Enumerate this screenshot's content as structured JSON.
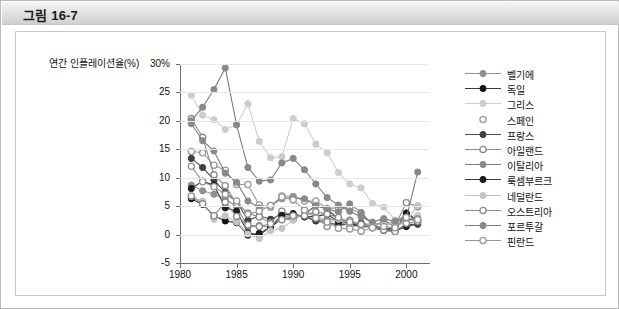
{
  "figure": {
    "title": "그림 16-7"
  },
  "chart_data": {
    "type": "line",
    "title": "",
    "xlabel": "",
    "ylabel": "연간 인플레이션율(%)",
    "ylim": [
      -5,
      30
    ],
    "xlim": [
      1980,
      2002
    ],
    "ytick_labels": [
      "30%",
      "25",
      "20",
      "15",
      "10",
      "5",
      "0",
      "-5"
    ],
    "yticks": [
      30,
      25,
      20,
      15,
      10,
      5,
      0,
      -5
    ],
    "xticks": [
      1980,
      1985,
      1990,
      1995,
      2000
    ],
    "xtick_labels": [
      "1980",
      "1985",
      "1990",
      "1995",
      "2000"
    ],
    "grid": true,
    "legend_position": "right",
    "x": [
      1981,
      1982,
      1983,
      1984,
      1985,
      1986,
      1987,
      1988,
      1989,
      1990,
      1991,
      1992,
      1993,
      1994,
      1995,
      1996,
      1997,
      1998,
      1999,
      2000,
      2001
    ],
    "series": [
      {
        "name": "벨기에",
        "marker": "circle-gray",
        "color": "#8f8f8f",
        "line": "#8f8f8f",
        "values": [
          8.7,
          7.7,
          7.1,
          6.3,
          4.9,
          1.3,
          1.6,
          1.2,
          3.1,
          3.4,
          3.2,
          2.4,
          2.8,
          2.4,
          1.5,
          2.1,
          1.6,
          0.9,
          1.1,
          2.7,
          2.4
        ]
      },
      {
        "name": "독일",
        "marker": "circle-black",
        "color": "#151515",
        "line": "#3a3a3a",
        "values": [
          6.3,
          5.3,
          3.3,
          2.4,
          2.1,
          -0.1,
          0.2,
          1.3,
          2.8,
          2.7,
          3.6,
          5.1,
          4.5,
          2.7,
          1.8,
          1.5,
          1.8,
          0.9,
          0.6,
          1.4,
          1.9
        ]
      },
      {
        "name": "그리스",
        "marker": "circle-lightgray",
        "color": "#cccccc",
        "line": "#cfcfcf",
        "values": [
          24.5,
          21.0,
          20.2,
          18.5,
          19.3,
          23.0,
          16.4,
          13.5,
          13.7,
          20.4,
          19.5,
          15.9,
          14.4,
          10.9,
          8.9,
          8.2,
          5.5,
          4.8,
          2.6,
          3.2,
          3.4
        ]
      },
      {
        "name": "스페인",
        "marker": "circle-open",
        "color": "#ffffff",
        "line": "#9a9a9a",
        "values": [
          14.6,
          14.4,
          12.2,
          11.3,
          8.8,
          8.8,
          5.2,
          4.8,
          6.8,
          6.7,
          5.9,
          5.9,
          4.6,
          4.7,
          4.7,
          3.6,
          1.9,
          1.8,
          2.2,
          3.5,
          2.8
        ]
      },
      {
        "name": "프랑스",
        "marker": "circle-darkgray",
        "color": "#404040",
        "line": "#4d4d4d",
        "values": [
          13.4,
          11.8,
          9.6,
          7.4,
          5.8,
          2.5,
          3.3,
          2.7,
          3.6,
          3.4,
          3.2,
          2.4,
          2.1,
          1.7,
          1.8,
          2.0,
          1.2,
          0.7,
          0.6,
          1.8,
          1.8
        ]
      },
      {
        "name": "아일랜드",
        "marker": "circle-open",
        "color": "#ffffff",
        "line": "#8b8b8b",
        "values": [
          20.4,
          17.1,
          10.5,
          8.6,
          5.4,
          3.8,
          3.1,
          2.1,
          4.1,
          3.3,
          3.2,
          3.1,
          1.4,
          2.3,
          2.5,
          1.7,
          1.4,
          2.4,
          1.6,
          5.6,
          4.9
        ]
      },
      {
        "name": "이탈리아",
        "marker": "circle-medgray",
        "color": "#8a8a8a",
        "line": "#7d7d7d",
        "values": [
          19.5,
          16.5,
          14.7,
          10.8,
          9.2,
          5.9,
          4.7,
          5.1,
          6.3,
          6.5,
          6.3,
          5.1,
          4.5,
          4.0,
          5.4,
          3.9,
          1.8,
          2.0,
          1.7,
          2.6,
          2.7
        ]
      },
      {
        "name": "룩셈부르크",
        "marker": "circle-black",
        "color": "#1d1d1d",
        "line": "#3a3a3a",
        "values": [
          8.1,
          9.4,
          8.7,
          4.7,
          4.1,
          0.3,
          -0.1,
          1.4,
          3.4,
          3.7,
          3.1,
          3.2,
          3.6,
          2.2,
          1.9,
          1.4,
          1.4,
          1.0,
          1.0,
          3.8,
          2.4
        ]
      },
      {
        "name": "네덜란드",
        "marker": "circle-lightgray",
        "color": "#c4c4c4",
        "line": "#c0c0c0",
        "values": [
          6.7,
          5.9,
          2.7,
          3.3,
          2.2,
          0.1,
          -0.7,
          0.7,
          1.1,
          2.5,
          3.9,
          3.7,
          2.1,
          2.7,
          1.4,
          1.4,
          1.9,
          1.8,
          2.0,
          2.3,
          5.1
        ]
      },
      {
        "name": "오스트리아",
        "marker": "circle-open",
        "color": "#ffffff",
        "line": "#8b8b8b",
        "values": [
          6.8,
          5.4,
          3.3,
          5.7,
          3.2,
          1.7,
          1.4,
          1.9,
          2.6,
          3.3,
          3.3,
          4.0,
          3.6,
          3.0,
          2.2,
          1.8,
          1.2,
          0.8,
          0.5,
          2.0,
          2.3
        ]
      },
      {
        "name": "포르투갈",
        "marker": "circle-medgray",
        "color": "#898989",
        "line": "#7d7d7d",
        "values": [
          20.0,
          22.4,
          25.5,
          29.3,
          19.3,
          11.8,
          9.4,
          9.6,
          12.6,
          13.4,
          11.4,
          8.9,
          6.5,
          5.2,
          4.1,
          3.1,
          2.2,
          2.8,
          2.3,
          2.9,
          11.0
        ]
      },
      {
        "name": "핀란드",
        "marker": "circle-open",
        "color": "#ffffff",
        "line": "#969696",
        "values": [
          12.0,
          9.3,
          8.4,
          7.1,
          5.9,
          3.6,
          4.1,
          5.1,
          6.6,
          6.1,
          4.3,
          2.9,
          2.2,
          1.1,
          1.0,
          0.6,
          1.2,
          1.4,
          1.2,
          3.0,
          2.6
        ]
      }
    ]
  }
}
